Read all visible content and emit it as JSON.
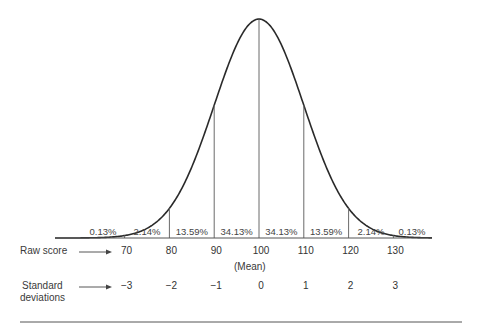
{
  "chart_data": {
    "type": "line",
    "title": "",
    "mean": 100,
    "sd": 10,
    "raw_score_label": "Raw score",
    "sd_label_line1": "Standard",
    "sd_label_line2": "deviations",
    "mean_label": "(Mean)",
    "raw_scores": [
      "70",
      "80",
      "90",
      "100",
      "110",
      "120",
      "130"
    ],
    "standard_deviations": [
      "−3",
      "−2",
      "−1",
      "0",
      "1",
      "2",
      "3"
    ],
    "regions": [
      {
        "range": "<70",
        "percent": "0.13%"
      },
      {
        "range": "70-80",
        "percent": "2.14%"
      },
      {
        "range": "80-90",
        "percent": "13.59%"
      },
      {
        "range": "90-100",
        "percent": "34.13%"
      },
      {
        "range": "100-110",
        "percent": "34.13%"
      },
      {
        "range": "110-120",
        "percent": "13.59%"
      },
      {
        "range": "120-130",
        "percent": "2.14%"
      },
      {
        "range": ">130",
        "percent": "0.13%"
      }
    ],
    "grid": false,
    "legend": "none"
  }
}
